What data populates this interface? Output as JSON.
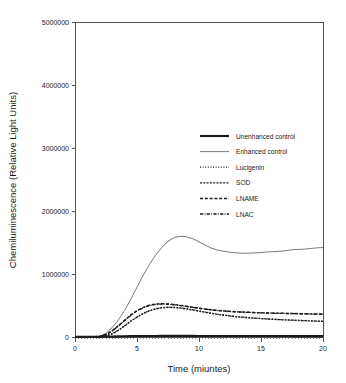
{
  "chart_data": {
    "type": "line",
    "title": "",
    "xlabel": "Time (miuntes)",
    "ylabel": "Chemiluminescence (Relative Light Units)",
    "xlim": [
      0,
      20
    ],
    "ylim": [
      0,
      5000000
    ],
    "xticks": [
      0,
      5,
      10,
      15,
      20
    ],
    "xtick_labels": [
      "0",
      "5",
      "10",
      "15",
      "20"
    ],
    "yticks": [
      0,
      1000000,
      2000000,
      3000000,
      4000000,
      5000000
    ],
    "ytick_labels": [
      "0",
      "1000000",
      "2000000",
      "3000000",
      "4000000",
      "5000000"
    ],
    "grid": false,
    "legend_position": "upper right",
    "x": [
      0,
      0.5,
      1,
      1.5,
      2,
      2.5,
      3,
      3.5,
      4,
      4.5,
      5,
      5.5,
      6,
      6.5,
      7,
      7.5,
      8,
      8.5,
      9,
      9.5,
      10,
      10.5,
      11,
      11.5,
      12,
      12.5,
      13,
      13.5,
      14,
      14.5,
      15,
      15.5,
      16,
      16.5,
      17,
      17.5,
      18,
      18.5,
      19,
      19.5,
      20
    ],
    "series": [
      {
        "name": "Unenhanced control",
        "style": "solid-thick",
        "color": "#1a1a1a",
        "width": 2.1,
        "dash": "",
        "values": [
          3000,
          3000,
          3500,
          4000,
          5000,
          6000,
          8000,
          10000,
          12000,
          14000,
          15000,
          16000,
          17000,
          17000,
          18000,
          18000,
          18000,
          18000,
          18000,
          17500,
          17000,
          17000,
          16500,
          16500,
          16000,
          16000,
          16000,
          15500,
          15500,
          15500,
          15000,
          15000,
          15000,
          15000,
          15000,
          14500,
          14500,
          14500,
          14000,
          14000,
          14000
        ]
      },
      {
        "name": "Enhanced control",
        "style": "solid-thin",
        "color": "#6b6b6b",
        "width": 0.9,
        "dash": "",
        "values": [
          4000,
          4000,
          5000,
          7000,
          12000,
          60000,
          150000,
          270000,
          420000,
          600000,
          790000,
          980000,
          1150000,
          1300000,
          1420000,
          1520000,
          1580000,
          1600000,
          1590000,
          1560000,
          1510000,
          1460000,
          1410000,
          1380000,
          1360000,
          1345000,
          1335000,
          1330000,
          1330000,
          1335000,
          1340000,
          1350000,
          1355000,
          1360000,
          1370000,
          1385000,
          1390000,
          1395000,
          1405000,
          1415000,
          1420000
        ]
      },
      {
        "name": "Lucigenin",
        "style": "fine-dotted",
        "color": "#1a1a1a",
        "width": 1.25,
        "dash": "1,1.6",
        "values": [
          2000,
          2000,
          2500,
          3000,
          6000,
          20000,
          55000,
          110000,
          180000,
          255000,
          320000,
          375000,
          420000,
          450000,
          468000,
          475000,
          472000,
          463000,
          450000,
          433000,
          415000,
          396000,
          378000,
          362000,
          348000,
          336000,
          325000,
          315000,
          307000,
          300000,
          294000,
          288000,
          282000,
          277000,
          272000,
          268000,
          264000,
          260000,
          256000,
          253000,
          250000
        ]
      },
      {
        "name": "SOD",
        "style": "dense-dash",
        "color": "#1a1a1a",
        "width": 1.35,
        "dash": "2,1.3",
        "values": [
          2000,
          2000,
          2500,
          3000,
          5500,
          18000,
          50000,
          105000,
          175000,
          250000,
          315000,
          370000,
          415000,
          445000,
          462000,
          470000,
          467000,
          458000,
          445000,
          428000,
          410000,
          392000,
          375000,
          359000,
          345000,
          333000,
          322000,
          313000,
          305000,
          298000,
          292000,
          286000,
          280000,
          275000,
          271000,
          267000,
          263000,
          259000,
          255000,
          252000,
          249000
        ]
      },
      {
        "name": "LNAME",
        "style": "dashed",
        "color": "#1a1a1a",
        "width": 1.45,
        "dash": "3,1.8",
        "values": [
          2500,
          2500,
          3000,
          4000,
          9000,
          40000,
          100000,
          180000,
          265000,
          350000,
          420000,
          470000,
          505000,
          522000,
          528000,
          524000,
          515000,
          502000,
          488000,
          472000,
          457000,
          444000,
          432000,
          422000,
          414000,
          407000,
          401000,
          396000,
          392000,
          388000,
          385000,
          382000,
          379000,
          377000,
          375000,
          373000,
          371000,
          369000,
          367000,
          365000,
          363000
        ]
      },
      {
        "name": "LNAC",
        "style": "dash-dot",
        "color": "#1a1a1a",
        "width": 1.3,
        "dash": "3.2,1.3,0.9,1.3",
        "values": [
          2500,
          2500,
          3000,
          4000,
          8500,
          38000,
          96000,
          175000,
          258000,
          343000,
          414000,
          464000,
          500000,
          518000,
          524000,
          520000,
          511000,
          498000,
          485000,
          469000,
          455000,
          442000,
          430000,
          420000,
          412000,
          405000,
          399000,
          394000,
          390000,
          386000,
          383000,
          380000,
          377000,
          375000,
          373000,
          371000,
          369000,
          367000,
          365000,
          363000,
          361000
        ]
      }
    ]
  },
  "figure": {
    "background_color": "#ffffff",
    "axis_color": "#555555",
    "text_color": "#1a1a1a"
  }
}
